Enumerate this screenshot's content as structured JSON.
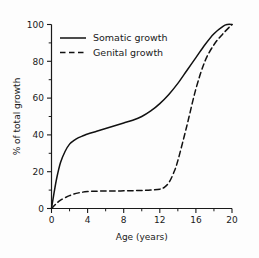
{
  "chart_data": {
    "type": "line",
    "title": "",
    "xlabel": "Age (years)",
    "ylabel": "% of total growth",
    "xlim": [
      0,
      20
    ],
    "ylim": [
      0,
      100
    ],
    "xticks": [
      0,
      4,
      8,
      12,
      16,
      20
    ],
    "xticks_minor": [
      2,
      6,
      10,
      14,
      18
    ],
    "yticks": [
      0,
      20,
      40,
      60,
      80,
      100
    ],
    "yticks_minor": [
      10,
      30,
      50,
      70,
      90
    ],
    "grid": false,
    "legend_position": "upper-left",
    "series": [
      {
        "name": "Somatic growth",
        "style": "solid",
        "color": "#111111",
        "x": [
          0,
          0.3,
          0.6,
          1.0,
          1.5,
          2.0,
          2.5,
          3.0,
          3.5,
          4.0,
          5.0,
          6.0,
          7.0,
          8.0,
          9.0,
          10.0,
          11.0,
          12.0,
          13.0,
          14.0,
          15.0,
          16.0,
          17.0,
          18.0,
          19.0,
          19.5,
          20.0
        ],
        "values": [
          0,
          9,
          17,
          25,
          31,
          35,
          37,
          38.5,
          39.5,
          40.5,
          42,
          43.5,
          45,
          46.5,
          48,
          50,
          53,
          57,
          62,
          68,
          75,
          82,
          89,
          95,
          99,
          100,
          100
        ]
      },
      {
        "name": "Genital growth",
        "style": "dashed",
        "color": "#111111",
        "x": [
          0,
          0.5,
          1.0,
          2.0,
          3.0,
          4.0,
          5.0,
          6.0,
          7.0,
          8.0,
          9.0,
          10.0,
          11.0,
          12.0,
          12.5,
          13.0,
          13.5,
          14.0,
          15.0,
          16.0,
          17.0,
          18.0,
          19.0,
          20.0
        ],
        "values": [
          0,
          2.5,
          4.5,
          7,
          8.5,
          9.2,
          9.4,
          9.5,
          9.5,
          9.6,
          9.7,
          9.8,
          10,
          10.5,
          11.5,
          14,
          19,
          26,
          45,
          65,
          80,
          89,
          95,
          100
        ]
      }
    ]
  },
  "legend": {
    "entries": [
      {
        "label": "Somatic growth",
        "style": "solid"
      },
      {
        "label": "Genital growth",
        "style": "dashed"
      }
    ]
  },
  "axis_labels": {
    "x_title": "Age (years)",
    "y_title": "% of total growth"
  },
  "x_tick_labels": [
    "0",
    "4",
    "8",
    "12",
    "16",
    "20"
  ],
  "y_tick_labels": [
    "0",
    "20",
    "40",
    "60",
    "80",
    "100"
  ]
}
